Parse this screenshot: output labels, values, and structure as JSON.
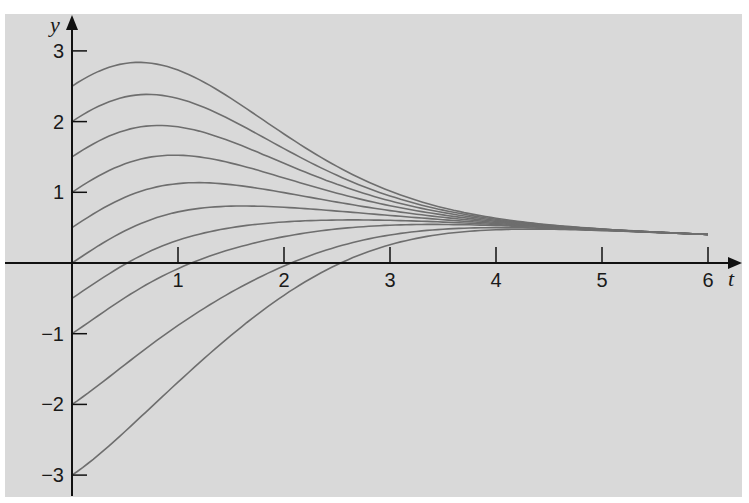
{
  "chart_data": {
    "type": "line",
    "title": "",
    "xlabel": "t",
    "ylabel": "y",
    "xlim": [
      0,
      6
    ],
    "ylim": [
      -3.3,
      3.3
    ],
    "grid": false,
    "legend": null,
    "background": "#d9d9d9",
    "line_color": "#6e6e6e",
    "x_ticks": [
      1,
      2,
      3,
      4,
      5,
      6
    ],
    "x_tick_labels": [
      "1",
      "2",
      "3",
      "4",
      "5",
      "6"
    ],
    "y_ticks": [
      -3,
      -2,
      -1,
      1,
      2,
      3
    ],
    "y_tick_labels": [
      "−3",
      "−2",
      "−1",
      "1",
      "2",
      "3"
    ],
    "t": [
      0,
      0.25,
      0.5,
      0.75,
      1,
      1.25,
      1.5,
      1.75,
      2,
      2.5,
      3,
      3.5,
      4,
      4.5,
      5,
      5.5,
      6
    ],
    "series": [
      {
        "name": "y0=2.5",
        "y0": 2.5
      },
      {
        "name": "y0=2.0",
        "y0": 2.0
      },
      {
        "name": "y0=1.5",
        "y0": 1.5
      },
      {
        "name": "y0=1.0",
        "y0": 1.0
      },
      {
        "name": "y0=0.5",
        "y0": 0.5
      },
      {
        "name": "y0=0.0",
        "y0": 0.0
      },
      {
        "name": "y0=-0.5",
        "y0": -0.5
      },
      {
        "name": "y0=-1.0",
        "y0": -1.0
      },
      {
        "name": "y0=-2.0",
        "y0": -2.0
      },
      {
        "name": "y0=-3.0",
        "y0": -3.0
      }
    ],
    "model": {
      "description": "y(t) = g(t) + y0*exp(-k*t^2), g(t) = a*t/(t^2+a)",
      "a": 2.6,
      "k": 0.22
    },
    "annotations": {
      "convergence": "All solution curves converge near t≈3.5–4, approaching y≈0.4 at t=6",
      "x_axis_crossings": {
        "y0=-0.5": 0.5,
        "y0=-1.0": 0.9,
        "y0=-2.0": 1.6,
        "y0=-3.0": 2.0
      }
    }
  }
}
